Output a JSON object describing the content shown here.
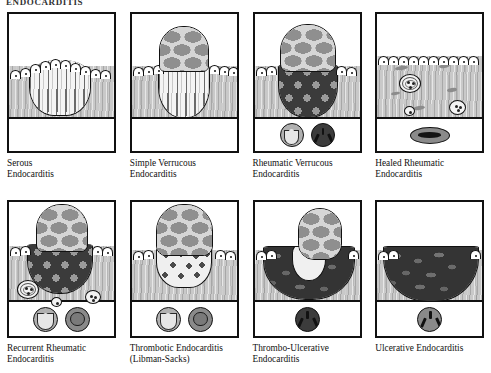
{
  "plate": {
    "title": "ENDOCARDITIS",
    "columns": 4,
    "rows": 2
  },
  "panels": [
    {
      "id": "serous-endocarditis",
      "caption": "Serous\nEndocarditis",
      "figure": {
        "description": "Low dome-shaped swelling of the valve with intact endothelial cell layer arching over pale serous edema fluid containing wavy fibrin strands.",
        "endothelium": "intact",
        "vegetation": "none",
        "lesion_fill": "serous-edema",
        "insets": []
      }
    },
    {
      "id": "simple-verrucous-endocarditis",
      "caption": "Simple Verrucous\nEndocarditis",
      "figure": {
        "description": "Single rounded cobblestone vegetation projecting above the endothelial surface, with pale serous edema in the underlying valve tissue.",
        "endothelium": "interrupted at vegetation base",
        "vegetation": "cobblestone-fibrin-cap",
        "lesion_fill": "serous-edema",
        "insets": []
      }
    },
    {
      "id": "rheumatic-verrucous-endocarditis",
      "caption": "Rheumatic Verrucous\nEndocarditis",
      "figure": {
        "description": "Cobblestone vegetation above the surface continuous with a dark granular inflammatory mass extending deep into the valve substance.",
        "endothelium": "interrupted at vegetation base",
        "vegetation": "cobblestone-fibrin-cap",
        "lesion_fill": "dark-granular-inflammation",
        "insets": [
          {
            "name": "valve-cross-section-cusp",
            "style": "gray-cusp"
          },
          {
            "name": "valve-cross-section-orifice",
            "style": "dark-trifoliate"
          }
        ]
      }
    },
    {
      "id": "healed-rheumatic-endocarditis",
      "caption": "Healed Rheumatic\nEndocarditis",
      "figure": {
        "description": "Smooth re-endothelialized surface over fibrotic valve tissue containing scattered Aschoff bodies and elongated scar streaks.",
        "endothelium": "intact and continuous",
        "vegetation": "none",
        "lesion_fill": "fibrous-scar",
        "aschoff_bodies": 3,
        "insets": [
          {
            "name": "valve-cross-section-thickened",
            "style": "flat-oval-slit"
          }
        ]
      }
    },
    {
      "id": "recurrent-rheumatic-endocarditis",
      "caption": "Recurrent Rheumatic\nEndocarditis",
      "figure": {
        "description": "Fresh cobblestone vegetation with deep dark granular inflammation superimposed on previously scarred tissue containing residual Aschoff bodies.",
        "endothelium": "interrupted at vegetation base",
        "vegetation": "cobblestone-fibrin-cap",
        "lesion_fill": "dark-granular-inflammation",
        "aschoff_bodies": 3,
        "insets": [
          {
            "name": "valve-cross-section-cusp",
            "style": "gray-cusp"
          },
          {
            "name": "valve-cross-section-nodular",
            "style": "ring-nodule"
          }
        ]
      }
    },
    {
      "id": "thrombotic-endocarditis-libman-sacks",
      "caption": "Thrombotic Endocarditis\n(Libman-Sacks)",
      "figure": {
        "description": "Tall broad-based cobblestone thrombotic vegetation with scattered dark granules spilling into the superficial valve tissue.",
        "endothelium": "interrupted at vegetation base",
        "vegetation": "tall-cobblestone-thrombus",
        "lesion_fill": "scattered-granules",
        "insets": [
          {
            "name": "valve-cross-section-cusp",
            "style": "gray-cusp"
          },
          {
            "name": "valve-cross-section-nodular",
            "style": "ring-nodule"
          }
        ]
      }
    },
    {
      "id": "thrombo-ulcerative-endocarditis",
      "caption": "Thrombo-Ulcerative\nEndocarditis",
      "figure": {
        "description": "Deep dark necrotic ulcer crater eroding the valve with an adherent cobblestone thrombotic vegetation rising from its right margin.",
        "endothelium": "destroyed over ulcer",
        "vegetation": "cobblestone-thrombus-on-ulcer",
        "lesion_fill": "necrotic-ulcer-crater",
        "insets": [
          {
            "name": "valve-cross-section-orifice",
            "style": "dark-trifoliate"
          }
        ]
      }
    },
    {
      "id": "ulcerative-endocarditis",
      "caption": "Ulcerative Endocarditis",
      "figure": {
        "description": "Broad deep dark necrotic ulcer crater destroying the valve substance with no overlying vegetation.",
        "endothelium": "destroyed over ulcer",
        "vegetation": "none",
        "lesion_fill": "necrotic-ulcer-crater",
        "insets": [
          {
            "name": "valve-cross-section-orifice",
            "style": "dark-trifoliate"
          }
        ]
      }
    }
  ],
  "colors": {
    "ink": "#111111",
    "tissue_gray": "#c9c9c9",
    "fibrin_gray": "#8f8f8f",
    "cobble_bg": "#d6d6d6",
    "dark_mass": "#3a3a3a",
    "pale_fill": "#f2f2f2",
    "page_background": "#ffffff"
  }
}
